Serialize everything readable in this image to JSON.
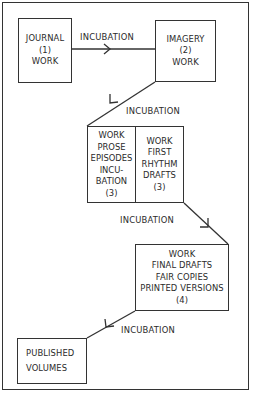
{
  "diagram": {
    "boxes": {
      "journal": {
        "lines": [
          "JOURNAL",
          "(1)",
          "WORK"
        ]
      },
      "imagery": {
        "lines": [
          "IMAGERY",
          "(2)",
          "WORK"
        ]
      },
      "prose": {
        "lines": [
          "WORK",
          "PROSE",
          "EPISODES",
          "INCU-",
          "BATION",
          "(3)"
        ]
      },
      "rhythm": {
        "lines": [
          "WORK",
          "FIRST",
          "RHYTHM",
          "DRAFTS",
          "(3)"
        ]
      },
      "final": {
        "lines": [
          "WORK",
          "FINAL DRAFTS",
          "FAIR COPIES",
          "PRINTED VERSIONS",
          "(4)"
        ]
      },
      "published": {
        "lines": [
          "PUBLISHED",
          "VOLUMES"
        ]
      }
    },
    "edge_labels": [
      "INCUBATION",
      "INCUBATION",
      "INCUBATION",
      "INCUBATION"
    ],
    "line_color": "#333333",
    "background": "#ffffff"
  }
}
